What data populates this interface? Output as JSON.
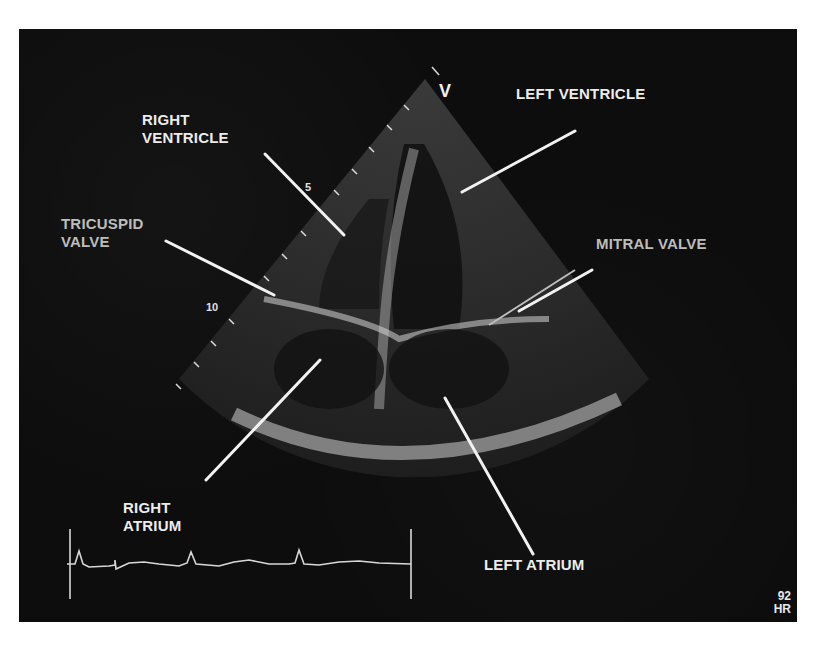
{
  "image": {
    "title": "Apical four-chamber echocardiogram",
    "orientation_marker": "V",
    "depth_markers": [
      "5",
      "10"
    ],
    "heart_rate": {
      "value": "92",
      "unit": "HR"
    },
    "labels": {
      "right_ventricle": [
        "RIGHT",
        "VENTRICLE"
      ],
      "left_ventricle": "LEFT VENTRICLE",
      "tricuspid_valve": [
        "TRICUSPID",
        "VALVE"
      ],
      "mitral_valve": "MITRAL VALVE",
      "right_atrium": [
        "RIGHT",
        "ATRIUM"
      ],
      "left_atrium": "LEFT ATRIUM"
    },
    "colors": {
      "background": "#0d0d0d",
      "label": "#ececec",
      "label_gray": "#bdbdbd"
    }
  }
}
